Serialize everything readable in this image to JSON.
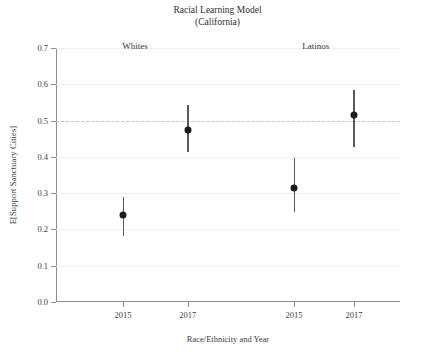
{
  "chart_data": {
    "type": "scatter",
    "title": "Racial Learning Model",
    "subtitle": "(California)",
    "xlabel": "Race/Ethnicity and Year",
    "ylabel": "E[Support Sanctuary Cities]",
    "ylim": [
      0.0,
      0.7
    ],
    "yticks": [
      "0.0",
      "0.1",
      "0.2",
      "0.3",
      "0.4",
      "0.5",
      "0.6",
      "0.7"
    ],
    "ytick_values": [
      0.0,
      0.1,
      0.2,
      0.3,
      0.4,
      0.5,
      0.6,
      0.7
    ],
    "grid": "horizontal dotted gridlines",
    "legend": "none",
    "reference_line": {
      "value": 0.5,
      "style": "dashed"
    },
    "group_labels": [
      {
        "label": "Whites",
        "x_frac": 0.23
      },
      {
        "label": "Latinos",
        "x_frac": 0.755
      }
    ],
    "categories": [
      "2015",
      "2017",
      "2015",
      "2017"
    ],
    "xtick_labels": [
      "2015",
      "2017",
      "2015",
      "2017"
    ],
    "points": [
      {
        "group": "Whites",
        "year": "2015",
        "x_frac": 0.195,
        "value": 0.24,
        "ci_low": 0.182,
        "ci_high": 0.288
      },
      {
        "group": "Whites",
        "year": "2017",
        "x_frac": 0.383,
        "value": 0.475,
        "ci_low": 0.412,
        "ci_high": 0.542
      },
      {
        "group": "Latinos",
        "year": "2015",
        "x_frac": 0.692,
        "value": 0.315,
        "ci_low": 0.248,
        "ci_high": 0.396
      },
      {
        "group": "Latinos",
        "year": "2017",
        "x_frac": 0.866,
        "value": 0.515,
        "ci_low": 0.427,
        "ci_high": 0.584
      }
    ]
  },
  "colors": {
    "point": "#1c1c1c",
    "whisker": "#5a5a5a",
    "axis": "#8d8d8d",
    "grid": "#e2e2e2",
    "refline": "#c9c9c9",
    "text": "#3a3a3a",
    "background": "#ffffff"
  }
}
